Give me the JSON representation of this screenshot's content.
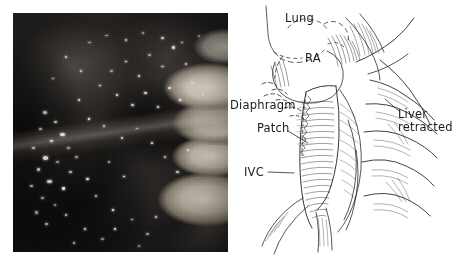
{
  "figure": {
    "panels": [
      {
        "id": "photograph",
        "kind": "intraoperative-photograph"
      },
      {
        "id": "illustration",
        "kind": "line-drawing-schematic"
      }
    ]
  },
  "photograph": {
    "description": "Intraoperative photograph of the operative field",
    "background_color": "#1c1a19",
    "highlight_color": "#f2f0ea",
    "pale_tissue_color": "#ded6ca"
  },
  "illustration": {
    "ink_color": "#2b2b2b",
    "background_color": "#ffffff",
    "labels": [
      {
        "name": "lung",
        "text": "Lung",
        "x": 57,
        "y": 12,
        "leader": false
      },
      {
        "name": "ra",
        "text": "RA",
        "x": 77,
        "y": 52,
        "leader": false
      },
      {
        "name": "diaphragm",
        "text": "Diaphragm",
        "x": 2,
        "y": 99,
        "leader": false
      },
      {
        "name": "patch",
        "text": "Patch",
        "x": 29,
        "y": 122,
        "leader": true
      },
      {
        "name": "ivc",
        "text": "IVC",
        "x": 16,
        "y": 166,
        "leader": true
      },
      {
        "name": "liver-retracted",
        "text": "Liver\nretracted",
        "x": 170,
        "y": 108,
        "leader": true
      }
    ],
    "label_text": {
      "lung": "Lung",
      "ra": "RA",
      "diaphragm": "Diaphragm",
      "patch": "Patch",
      "ivc": "IVC",
      "liver_line1": "Liver",
      "liver_line2": "retracted"
    }
  }
}
